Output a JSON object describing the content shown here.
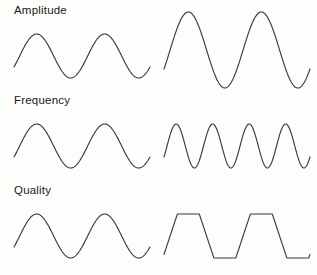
{
  "figure": {
    "background_color": "#fdfdfb",
    "stroke_color": "#3b3b3b",
    "width": 317,
    "height": 275
  },
  "rows": [
    {
      "label": "Amplitude",
      "left": {
        "caption": "reference sine wave",
        "waveform": "sine",
        "cycles": 2,
        "amplitude": 22,
        "baseline": 56
      },
      "right": {
        "caption": "larger amplitude sine wave",
        "waveform": "sine",
        "cycles": 2,
        "amplitude": 38,
        "baseline": 50
      }
    },
    {
      "label": "Frequency",
      "left": {
        "caption": "reference sine wave",
        "waveform": "sine",
        "cycles": 2,
        "amplitude": 22,
        "baseline": 56
      },
      "right": {
        "caption": "higher frequency sine wave",
        "waveform": "sine",
        "cycles": 4,
        "amplitude": 22,
        "baseline": 56
      }
    },
    {
      "label": "Quality",
      "left": {
        "caption": "reference sine wave",
        "waveform": "sine",
        "cycles": 2,
        "amplitude": 22,
        "baseline": 56
      },
      "right": {
        "caption": "trapezoidal distorted wave",
        "waveform": "trapezoid",
        "cycles": 2,
        "amplitude": 22,
        "baseline": 56
      }
    }
  ],
  "chart_data": {
    "type": "line",
    "xlabel": "",
    "ylabel": "",
    "grid": false,
    "legend": "none",
    "panels": [
      {
        "row_label": "Amplitude",
        "column": "left",
        "waveform": "sine",
        "cycles": 2,
        "amplitude": 22,
        "baseline": 56,
        "phase_start_deg": -30,
        "x_range": [
          14,
          150
        ]
      },
      {
        "row_label": "Amplitude",
        "column": "right",
        "waveform": "sine",
        "cycles": 2,
        "amplitude": 38,
        "baseline": 50,
        "phase_start_deg": -30,
        "x_range": [
          6,
          152
        ]
      },
      {
        "row_label": "Frequency",
        "column": "left",
        "waveform": "sine",
        "cycles": 2,
        "amplitude": 22,
        "baseline": 56,
        "phase_start_deg": -30,
        "x_range": [
          14,
          150
        ]
      },
      {
        "row_label": "Frequency",
        "column": "right",
        "waveform": "sine",
        "cycles": 4,
        "amplitude": 22,
        "baseline": 56,
        "phase_start_deg": -30,
        "x_range": [
          6,
          152
        ]
      },
      {
        "row_label": "Quality",
        "column": "left",
        "waveform": "sine",
        "cycles": 2,
        "amplitude": 22,
        "baseline": 56,
        "phase_start_deg": -30,
        "x_range": [
          14,
          150
        ]
      },
      {
        "row_label": "Quality",
        "column": "right",
        "waveform": "trapezoid",
        "cycles": 2,
        "amplitude": 22,
        "baseline": 56,
        "phase_start_deg": -30,
        "x_range": [
          6,
          152
        ],
        "flat_top_fraction": 0.3
      }
    ]
  }
}
